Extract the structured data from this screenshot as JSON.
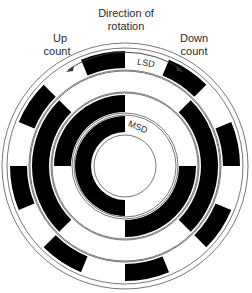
{
  "diagram": {
    "title_line1": "Direction of",
    "title_line2": "rotation",
    "left_label_line1": "Up",
    "left_label_line2": "count",
    "right_label_line1": "Down",
    "right_label_line2": "count",
    "lsd_label": "LSD",
    "msd_label": "MSD",
    "colors": {
      "ink": "#000000",
      "line": "#555555",
      "paper": "#ffffff"
    },
    "center": [
      125,
      166
    ],
    "outer_radius": 123,
    "rings": [
      {
        "name": "LSD",
        "r_inner": 98,
        "r_outer": 115,
        "black": [
          [
            -22.5,
            0
          ],
          [
            22.5,
            45
          ],
          [
            67.5,
            90
          ],
          [
            112.5,
            135
          ],
          [
            157.5,
            180
          ],
          [
            202.5,
            225
          ],
          [
            247.5,
            270
          ],
          [
            292.5,
            315
          ]
        ]
      },
      {
        "name": "ring-2",
        "r_inner": 76,
        "r_outer": 93,
        "black": [
          [
            45,
            135
          ],
          [
            225,
            315
          ]
        ]
      },
      {
        "name": "ring-3",
        "r_inner": 54,
        "r_outer": 71,
        "black": [
          [
            90,
            180
          ],
          [
            270,
            360
          ]
        ]
      },
      {
        "name": "MSD",
        "r_inner": 34,
        "r_outer": 50,
        "black": [
          [
            180,
            360
          ]
        ]
      }
    ]
  }
}
